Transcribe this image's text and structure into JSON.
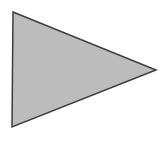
{
  "canvas": {
    "width": 164,
    "height": 141,
    "background": "#ffffff"
  },
  "shape": {
    "type": "triangle",
    "description": "right-pointing triangle",
    "points": "13,12 156,70 12,127",
    "fill": "#bcbcbc",
    "stroke": "#3d3d3d",
    "stroke_width": "1.5",
    "stroke_linejoin": "miter"
  }
}
